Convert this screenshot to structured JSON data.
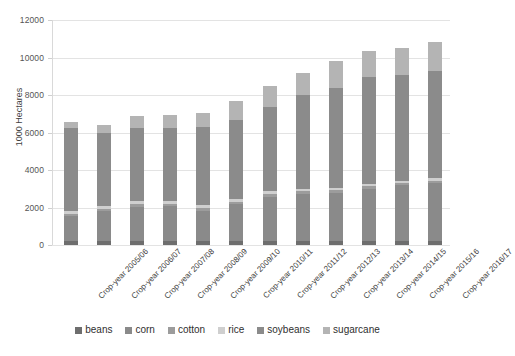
{
  "chart_data": {
    "type": "bar",
    "stacked": true,
    "title": "",
    "subtitle": "",
    "xlabel": "",
    "ylabel": "1000 Hectares",
    "ylim": [
      0,
      12000
    ],
    "ytick_values": [
      0,
      2000,
      4000,
      6000,
      8000,
      10000,
      12000
    ],
    "ytick_labels": [
      "0",
      "2000",
      "4000",
      "6000",
      "8000",
      "10000",
      "12000"
    ],
    "grid": true,
    "legend_position": "bottom",
    "categories": [
      "Crop-year 2005/06",
      "Crop-year 2006/07",
      "Crop-year 2007/08",
      "Crop-year 2008/09",
      "Crop-year 2009/10",
      "Crop-year 2010/11",
      "Crop-year 2011/12",
      "Crop-year 2012/13",
      "Crop-year 2013/14",
      "Crop-year 2014/15",
      "Crop-year 2015/16",
      "Crop-year 2016/17"
    ],
    "series": [
      {
        "name": "beans",
        "color": "#6e6e6e",
        "values": [
          230,
          220,
          220,
          220,
          220,
          220,
          210,
          210,
          210,
          210,
          200,
          200
        ]
      },
      {
        "name": "corn",
        "color": "#8a8a8a",
        "values": [
          1300,
          1570,
          1830,
          1840,
          1610,
          1950,
          2330,
          2490,
          2580,
          2790,
          3000,
          3100
        ]
      },
      {
        "name": "cotton",
        "color": "#9c9c9c",
        "values": [
          130,
          130,
          140,
          140,
          120,
          120,
          190,
          180,
          130,
          140,
          130,
          140
        ]
      },
      {
        "name": "rice",
        "color": "#cfcfcf",
        "values": [
          160,
          160,
          160,
          160,
          160,
          140,
          130,
          130,
          130,
          120,
          110,
          110
        ]
      },
      {
        "name": "soybeans",
        "color": "#8b8b8b",
        "values": [
          4420,
          3900,
          3910,
          3880,
          4180,
          4220,
          4500,
          5010,
          5320,
          5700,
          5620,
          5750
        ]
      },
      {
        "name": "sugarcane",
        "color": "#b4b4b4",
        "values": [
          300,
          420,
          620,
          680,
          730,
          1030,
          1120,
          1140,
          1470,
          1390,
          1450,
          1530
        ]
      }
    ],
    "totals": [
      6540,
      6400,
      6880,
      6920,
      7020,
      7680,
      8480,
      9160,
      9840,
      10350,
      10510,
      10830
    ]
  },
  "legend": {
    "items": [
      {
        "label": "beans",
        "swatch": "legend-swatch-beans"
      },
      {
        "label": "corn",
        "swatch": "legend-swatch-corn"
      },
      {
        "label": "cotton",
        "swatch": "legend-swatch-cotton"
      },
      {
        "label": "rice",
        "swatch": "legend-swatch-rice"
      },
      {
        "label": "soybeans",
        "swatch": "legend-swatch-soybeans"
      },
      {
        "label": "sugarcane",
        "swatch": "legend-swatch-sugarcane"
      }
    ]
  },
  "axis": {
    "y_title": "1000 Hectares"
  },
  "colors": {
    "background": "#ffffff",
    "grid": "#e3e3e3",
    "text": "#3f3f3f"
  }
}
